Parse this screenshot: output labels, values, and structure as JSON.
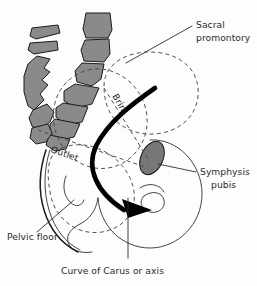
{
  "figure": {
    "title": "Curve of Carus or axis",
    "background_color": "#fdfdfd",
    "bone_fill_color": "#8a8a8a",
    "bone_stroke_color": "#1b1b1b",
    "dashed_line_color": "#4a4a4a",
    "text_color": "#2b2b2b",
    "arrow_color": "#000000"
  },
  "labels": {
    "sacral_promontory_line1": "Sacral",
    "sacral_promontory_line2": "promontory",
    "symphysis_pubis_line1": "Symphysis",
    "symphysis_pubis_line2": "pubis",
    "pelvic_floor": "Pelvic floor",
    "curve_of_carus": "Curve of Carus or axis",
    "brim": "Brim",
    "outlet": "Outlet"
  }
}
